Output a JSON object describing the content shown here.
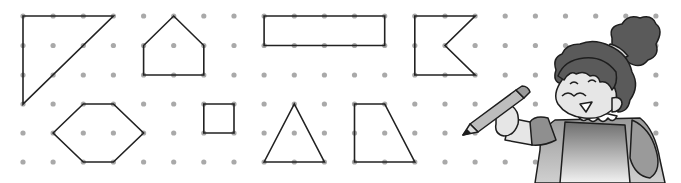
{
  "grid": {
    "origin_x": 23,
    "origin_y": 16,
    "spacing_x": 30.14,
    "rows_y": [
      16,
      45.5,
      75,
      104,
      133,
      162
    ],
    "columns": 22,
    "rows": 6,
    "dot_color": "#a9a9a9",
    "dot_radius": 2.6
  },
  "shapes": [
    {
      "name": "right-triangle",
      "points": [
        [
          0,
          0
        ],
        [
          3,
          0
        ],
        [
          0,
          3
        ]
      ]
    },
    {
      "name": "house-pentagon",
      "points": [
        [
          4,
          1
        ],
        [
          5,
          0
        ],
        [
          6,
          1
        ],
        [
          6,
          2
        ],
        [
          4,
          2
        ]
      ]
    },
    {
      "name": "hexagon",
      "points": [
        [
          1,
          4
        ],
        [
          2,
          3
        ],
        [
          3,
          3
        ],
        [
          4,
          4
        ],
        [
          3,
          5
        ],
        [
          2,
          5
        ]
      ]
    },
    {
      "name": "small-square",
      "points": [
        [
          6,
          3
        ],
        [
          7,
          3
        ],
        [
          7,
          4
        ],
        [
          6,
          4
        ]
      ]
    },
    {
      "name": "long-rectangle",
      "points": [
        [
          8,
          0
        ],
        [
          12,
          0
        ],
        [
          12,
          1
        ],
        [
          8,
          1
        ]
      ]
    },
    {
      "name": "isosceles-triangle",
      "points": [
        [
          8,
          5
        ],
        [
          9,
          3
        ],
        [
          10,
          5
        ]
      ]
    },
    {
      "name": "right-trapezoid",
      "points": [
        [
          11,
          3
        ],
        [
          12,
          3
        ],
        [
          13,
          5
        ],
        [
          11,
          5
        ]
      ]
    },
    {
      "name": "flag-concave-pentagon",
      "points": [
        [
          13,
          0
        ],
        [
          15,
          0
        ],
        [
          14,
          1
        ],
        [
          15,
          2
        ],
        [
          13,
          2
        ]
      ]
    }
  ],
  "colors": {
    "background": "#ffffff",
    "line": "#222222",
    "hair": "#5a5a5a",
    "skin": "#e6e6e6",
    "sleeve": "#8f8f8f",
    "apron": "#7a7a7a"
  },
  "illustration": {
    "subject": "cartoon girl holding a pencil",
    "pencil": "pencil-icon"
  }
}
